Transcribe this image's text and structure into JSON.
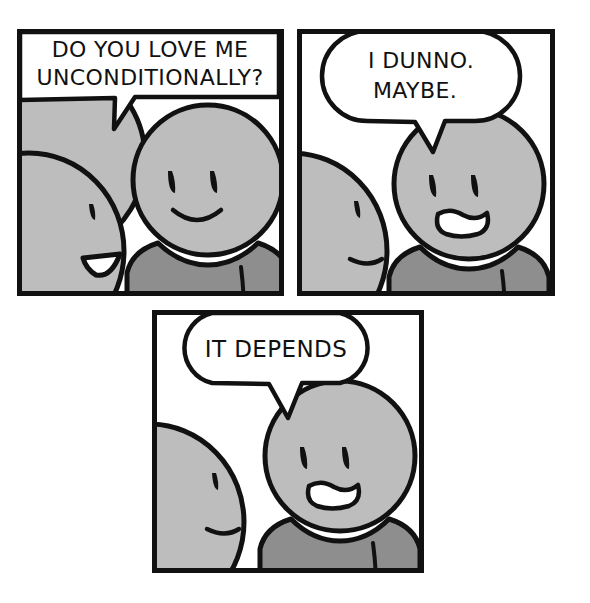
{
  "comic": {
    "title": "Do You Love Me Unconditionally",
    "panel_count": 3,
    "colors": {
      "ink": "#111111",
      "background": "#ffffff",
      "skin": "#bdbdbd",
      "shirt": "#8e8e8e",
      "cuff": "#cfcfcf",
      "bubble_fill": "#ffffff"
    },
    "panels": [
      {
        "id": "panel-1",
        "index": 1,
        "speech": {
          "lines": [
            "DO YOU LOVE ME",
            "UNCONDITIONALLY?"
          ],
          "bubble_shape": "rectangle",
          "tail_direction": "down-left",
          "speaker": "left-character"
        },
        "characters": [
          {
            "role": "left-character",
            "position": "left",
            "view": "three-quarter-back",
            "expression": "open-mouth-speaking",
            "mouth": "open-triangle",
            "visible_eyes": 1
          },
          {
            "role": "right-character",
            "position": "right",
            "view": "front",
            "expression": "smiling",
            "mouth": "smile-curve",
            "visible_eyes": 2
          }
        ]
      },
      {
        "id": "panel-2",
        "index": 2,
        "speech": {
          "lines": [
            "I DUNNO.",
            "MAYBE."
          ],
          "bubble_shape": "rounded-oval",
          "tail_direction": "down-right",
          "speaker": "right-character"
        },
        "characters": [
          {
            "role": "left-character",
            "position": "left",
            "view": "three-quarter-back",
            "expression": "neutral-frown",
            "mouth": "closed-frown-curve",
            "visible_eyes": 1
          },
          {
            "role": "right-character",
            "position": "right",
            "view": "front",
            "expression": "worried",
            "mouth": "open-wavy-frown",
            "visible_eyes": 2
          }
        ]
      },
      {
        "id": "panel-3",
        "index": 3,
        "speech": {
          "lines": [
            "IT DEPENDS"
          ],
          "bubble_shape": "rounded-oval",
          "tail_direction": "down-right",
          "speaker": "right-character"
        },
        "characters": [
          {
            "role": "left-character",
            "position": "left",
            "view": "three-quarter-back",
            "expression": "neutral-frown",
            "mouth": "closed-frown-curve",
            "visible_eyes": 1
          },
          {
            "role": "right-character",
            "position": "right",
            "view": "front",
            "expression": "worried",
            "mouth": "open-wavy-frown",
            "visible_eyes": 2
          }
        ]
      }
    ]
  }
}
